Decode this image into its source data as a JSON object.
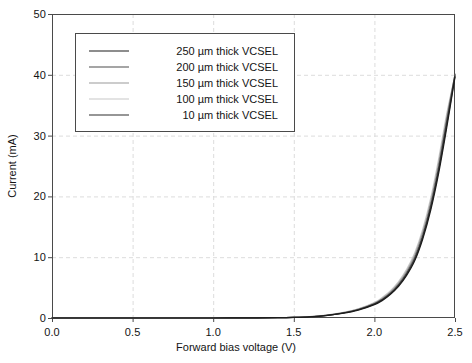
{
  "chart_data": {
    "type": "line",
    "title": "",
    "xlabel": "Forward bias voltage (V)",
    "ylabel": "Current (mA)",
    "xlim": [
      0.0,
      2.5
    ],
    "ylim": [
      0,
      50
    ],
    "xticks": [
      "0.0",
      "0.5",
      "1.0",
      "1.5",
      "2.0",
      "2.5"
    ],
    "xtick_values": [
      0.0,
      0.5,
      1.0,
      1.5,
      2.0,
      2.5
    ],
    "yticks": [
      "0",
      "10",
      "20",
      "30",
      "40",
      "50"
    ],
    "ytick_values": [
      0,
      10,
      20,
      30,
      40,
      50
    ],
    "grid": true,
    "grid_style": "dashed",
    "grid_color": "#dcdcdc",
    "legend_position": "upper left",
    "frame": true,
    "x": [
      0.0,
      0.2,
      0.4,
      0.6,
      0.8,
      1.0,
      1.2,
      1.4,
      1.5,
      1.6,
      1.7,
      1.8,
      1.9,
      2.0,
      2.05,
      2.1,
      2.15,
      2.2,
      2.25,
      2.3,
      2.35,
      2.4,
      2.45,
      2.5
    ],
    "series": [
      {
        "name": "250 µm thick VCSEL",
        "color": "#1c1c1c",
        "values": [
          0.0,
          0.0,
          0.0,
          0.0,
          0.0,
          0.0,
          0.02,
          0.05,
          0.1,
          0.2,
          0.4,
          0.75,
          1.3,
          2.2,
          2.9,
          3.9,
          5.2,
          7.0,
          9.4,
          13.0,
          17.8,
          24.0,
          31.5,
          39.6
        ]
      },
      {
        "name": "200 µm thick VCSEL",
        "color": "#4d4d4d",
        "values": [
          0.0,
          0.0,
          0.0,
          0.0,
          0.0,
          0.0,
          0.02,
          0.05,
          0.1,
          0.2,
          0.42,
          0.8,
          1.4,
          2.35,
          3.1,
          4.1,
          5.5,
          7.4,
          9.9,
          13.6,
          18.6,
          25.0,
          32.6,
          40.1
        ]
      },
      {
        "name": "150 µm thick VCSEL",
        "color": "#9a9a9a",
        "values": [
          0.0,
          0.0,
          0.0,
          0.0,
          0.0,
          0.0,
          0.02,
          0.05,
          0.1,
          0.21,
          0.44,
          0.84,
          1.45,
          2.45,
          3.25,
          4.3,
          5.75,
          7.7,
          10.3,
          14.1,
          19.2,
          25.7,
          33.2,
          40.0
        ]
      },
      {
        "name": "100 µm thick VCSEL",
        "color": "#c8c8c8",
        "values": [
          0.0,
          0.0,
          0.0,
          0.0,
          0.0,
          0.0,
          0.02,
          0.05,
          0.1,
          0.22,
          0.46,
          0.88,
          1.52,
          2.55,
          3.4,
          4.5,
          6.0,
          8.0,
          10.7,
          14.6,
          19.8,
          26.4,
          33.8,
          39.9
        ]
      },
      {
        "name": "10 µm thick VCSEL",
        "color": "#2e2e2e",
        "values": [
          0.0,
          0.0,
          0.0,
          0.0,
          0.0,
          0.0,
          0.02,
          0.05,
          0.1,
          0.2,
          0.41,
          0.78,
          1.35,
          2.28,
          3.0,
          4.0,
          5.35,
          7.2,
          9.6,
          13.3,
          18.2,
          24.5,
          32.0,
          39.8
        ]
      }
    ]
  },
  "axes": {
    "plot_left": 52,
    "plot_top": 14,
    "plot_right": 455,
    "plot_bottom": 318
  }
}
